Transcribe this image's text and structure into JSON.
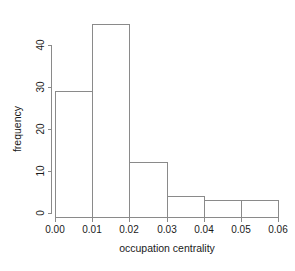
{
  "chart_data": {
    "type": "bar",
    "title": "",
    "subtitle": "",
    "xlabel": "occupation centrality",
    "ylabel": "frequency",
    "categories": [
      "0.00-0.01",
      "0.01-0.02",
      "0.02-0.03",
      "0.03-0.04",
      "0.04-0.05",
      "0.05-0.06"
    ],
    "bin_edges": [
      0.0,
      0.01,
      0.02,
      0.03,
      0.04,
      0.05,
      0.06
    ],
    "values": [
      30,
      46,
      13,
      5,
      4,
      4
    ],
    "bin_width": 0.01,
    "xlim": [
      0.0,
      0.06
    ],
    "ylim": [
      0,
      46
    ],
    "xticks": [
      0.0,
      0.01,
      0.02,
      0.03,
      0.04,
      0.05,
      0.06
    ],
    "xtick_labels": [
      "0.00",
      "0.01",
      "0.02",
      "0.03",
      "0.04",
      "0.05",
      "0.06"
    ],
    "yticks": [
      0,
      10,
      20,
      30,
      40
    ],
    "ytick_labels": [
      "0",
      "10",
      "20",
      "30",
      "40"
    ],
    "grid": false,
    "legend": false,
    "legend_position": "none",
    "bar_fill": "none",
    "bar_stroke": "#8a8a8a",
    "axis_color": "#8a8a8a",
    "background": "#ffffff",
    "text_color": "#1a1a1a",
    "ylabel_rotation": 90,
    "ytick_label_rotation": 90
  }
}
